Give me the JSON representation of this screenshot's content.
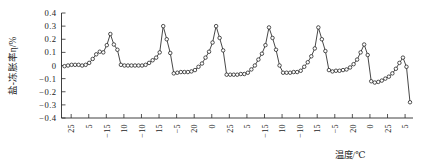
{
  "chart_data": {
    "type": "line",
    "title": "",
    "xlabel": "温度/℃",
    "ylabel": "盐-冻胀率η/%",
    "ylim": [
      -0.4,
      0.4
    ],
    "yticks": [
      "0.4",
      "0.3",
      "0.2",
      "0.1",
      "0",
      "-0.1",
      "-0.2",
      "-0.3",
      "-0.4"
    ],
    "xticks": [
      "25",
      "5",
      "-15",
      "10",
      "-10",
      "15",
      "-5",
      "20",
      "0",
      "25",
      "5",
      "-15",
      "10",
      "-10",
      "15",
      "-5",
      "20",
      "0",
      "25",
      "5"
    ],
    "grid": false,
    "legend": null,
    "marker": "open-circle",
    "series": [
      {
        "name": "盐-冻胀率η",
        "values": [
          -0.005,
          0.0,
          0.005,
          0.005,
          0.005,
          0.0,
          0.005,
          0.02,
          0.05,
          0.085,
          0.105,
          0.1,
          0.155,
          0.24,
          0.16,
          0.12,
          0.005,
          0.0,
          0.0,
          0.0,
          0.0,
          0.0,
          0.0,
          0.005,
          0.02,
          0.04,
          0.06,
          0.1,
          0.3,
          0.2,
          0.095,
          -0.06,
          -0.055,
          -0.05,
          -0.05,
          -0.05,
          -0.045,
          -0.035,
          -0.01,
          0.015,
          0.06,
          0.105,
          0.175,
          0.3,
          0.21,
          0.115,
          -0.07,
          -0.07,
          -0.07,
          -0.07,
          -0.065,
          -0.065,
          -0.055,
          -0.03,
          0.0,
          0.045,
          0.09,
          0.155,
          0.29,
          0.21,
          0.12,
          0.0,
          -0.055,
          -0.055,
          -0.055,
          -0.05,
          -0.05,
          -0.04,
          -0.01,
          0.025,
          0.07,
          0.13,
          0.29,
          0.2,
          0.11,
          -0.035,
          -0.045,
          -0.04,
          -0.04,
          -0.035,
          -0.03,
          -0.015,
          0.01,
          0.045,
          0.1,
          0.16,
          0.08,
          -0.12,
          -0.13,
          -0.125,
          -0.115,
          -0.1,
          -0.085,
          -0.06,
          -0.025,
          0.02,
          0.06,
          -0.01,
          -0.28
        ]
      }
    ]
  },
  "axis": {
    "y_title": "盐-冻胀率η/%",
    "x_title": "温度/℃"
  }
}
